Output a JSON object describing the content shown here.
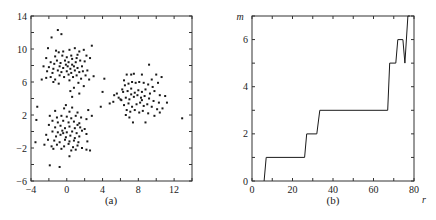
{
  "chart_data": [
    {
      "type": "scatter",
      "panel_label": "(a)",
      "title": "",
      "xlabel": "",
      "ylabel": "",
      "xlim": [
        -4,
        14
      ],
      "ylim": [
        -6,
        14
      ],
      "xticks": [
        -4,
        0,
        4,
        8,
        12
      ],
      "yticks": [
        -6,
        -2,
        2,
        6,
        10,
        14
      ],
      "xtick_labels": [
        "−4",
        "0",
        "4",
        "8",
        "12"
      ],
      "ytick_labels": [
        "−6",
        "−2",
        "2",
        "6",
        "10",
        "14"
      ],
      "minor_step": 2,
      "grid": false,
      "legend": null,
      "marker_color": "#1a1a1a",
      "series": [
        {
          "name": "cluster-upper-left",
          "points": [
            [
              -1.0,
              12.3
            ],
            [
              -0.6,
              11.8
            ],
            [
              -1.7,
              11.4
            ],
            [
              -2.1,
              10.1
            ],
            [
              -1.2,
              9.8
            ],
            [
              -0.9,
              9.6
            ],
            [
              -0.4,
              9.7
            ],
            [
              0.3,
              9.9
            ],
            [
              0.9,
              10.1
            ],
            [
              1.4,
              9.7
            ],
            [
              1.9,
              9.9
            ],
            [
              2.8,
              10.4
            ],
            [
              2.2,
              9.2
            ],
            [
              1.2,
              9.3
            ],
            [
              0.5,
              9.2
            ],
            [
              0.0,
              9.0
            ],
            [
              -0.5,
              9.2
            ],
            [
              -1.3,
              9.1
            ],
            [
              -2.3,
              8.9
            ],
            [
              -1.8,
              8.4
            ],
            [
              -1.1,
              8.6
            ],
            [
              -0.7,
              8.3
            ],
            [
              -0.2,
              8.6
            ],
            [
              0.2,
              8.4
            ],
            [
              0.6,
              8.8
            ],
            [
              1.0,
              8.4
            ],
            [
              1.5,
              8.6
            ],
            [
              2.0,
              8.5
            ],
            [
              2.6,
              8.9
            ],
            [
              -2.6,
              7.9
            ],
            [
              -2.0,
              7.8
            ],
            [
              -1.5,
              7.6
            ],
            [
              -0.8,
              7.9
            ],
            [
              -0.4,
              7.7
            ],
            [
              0.1,
              7.9
            ],
            [
              0.4,
              7.6
            ],
            [
              0.8,
              7.9
            ],
            [
              1.2,
              7.7
            ],
            [
              1.7,
              7.9
            ],
            [
              -2.2,
              7.3
            ],
            [
              -1.6,
              7.1
            ],
            [
              -1.0,
              7.4
            ],
            [
              -0.6,
              7.2
            ],
            [
              0.0,
              7.3
            ],
            [
              0.5,
              7.1
            ],
            [
              0.9,
              7.4
            ],
            [
              1.4,
              7.2
            ],
            [
              1.8,
              7.3
            ],
            [
              2.3,
              7.4
            ],
            [
              -2.8,
              6.3
            ],
            [
              -2.3,
              6.5
            ],
            [
              -1.8,
              6.6
            ],
            [
              -1.3,
              6.3
            ],
            [
              -0.8,
              6.8
            ],
            [
              -0.3,
              6.6
            ],
            [
              0.2,
              6.9
            ],
            [
              0.7,
              6.6
            ],
            [
              1.1,
              6.8
            ],
            [
              1.6,
              6.4
            ],
            [
              2.1,
              6.8
            ],
            [
              2.5,
              6.3
            ],
            [
              3.0,
              6.7
            ],
            [
              -1.5,
              6.0
            ],
            [
              -0.9,
              5.8
            ],
            [
              0.3,
              6.2
            ],
            [
              1.3,
              5.9
            ],
            [
              1.9,
              5.5
            ],
            [
              0.8,
              5.3
            ],
            [
              0.4,
              4.9
            ],
            [
              1.4,
              4.6
            ],
            [
              0.6,
              4.2
            ],
            [
              -0.1,
              8.1
            ],
            [
              0.6,
              8.1
            ],
            [
              -1.4,
              8.2
            ],
            [
              1.1,
              8.9
            ]
          ]
        },
        {
          "name": "cluster-lower-left",
          "points": [
            [
              -3.3,
              3.0
            ],
            [
              -3.4,
              1.4
            ],
            [
              -3.5,
              -1.3
            ],
            [
              -0.1,
              3.2
            ],
            [
              -0.3,
              2.8
            ],
            [
              0.6,
              2.9
            ],
            [
              -1.3,
              2.5
            ],
            [
              0.3,
              2.4
            ],
            [
              1.2,
              2.3
            ],
            [
              2.4,
              2.6
            ],
            [
              2.8,
              1.9
            ],
            [
              -1.9,
              1.9
            ],
            [
              -1.1,
              1.7
            ],
            [
              -0.6,
              1.9
            ],
            [
              0.0,
              1.8
            ],
            [
              0.5,
              1.6
            ],
            [
              1.0,
              1.9
            ],
            [
              1.6,
              1.7
            ],
            [
              2.2,
              1.5
            ],
            [
              -1.6,
              1.3
            ],
            [
              -1.0,
              1.1
            ],
            [
              -0.4,
              1.3
            ],
            [
              0.2,
              1.1
            ],
            [
              0.8,
              1.2
            ],
            [
              1.4,
              1.0
            ],
            [
              -2.0,
              0.8
            ],
            [
              -1.3,
              0.5
            ],
            [
              -0.7,
              0.7
            ],
            [
              -0.2,
              0.4
            ],
            [
              0.3,
              0.6
            ],
            [
              0.9,
              0.4
            ],
            [
              1.5,
              0.5
            ],
            [
              2.0,
              0.3
            ],
            [
              -1.6,
              0.0
            ],
            [
              -1.0,
              -0.1
            ],
            [
              -0.5,
              0.1
            ],
            [
              0.0,
              -0.1
            ],
            [
              0.6,
              0.0
            ],
            [
              1.1,
              -0.2
            ],
            [
              1.7,
              0.1
            ],
            [
              -2.3,
              -0.4
            ],
            [
              -1.2,
              -0.6
            ],
            [
              -0.7,
              -0.4
            ],
            [
              -0.1,
              -0.7
            ],
            [
              0.4,
              -0.5
            ],
            [
              0.9,
              -0.8
            ],
            [
              1.4,
              -0.6
            ],
            [
              2.2,
              -0.3
            ],
            [
              -2.1,
              -1.0
            ],
            [
              -1.4,
              -1.1
            ],
            [
              -0.8,
              -1.3
            ],
            [
              -0.2,
              -1.0
            ],
            [
              0.3,
              -1.2
            ],
            [
              0.8,
              -1.1
            ],
            [
              1.3,
              -1.3
            ],
            [
              2.3,
              -1.2
            ],
            [
              -2.5,
              -1.6
            ],
            [
              -1.7,
              -1.8
            ],
            [
              -1.1,
              -1.6
            ],
            [
              -0.3,
              -1.8
            ],
            [
              0.2,
              -1.5
            ],
            [
              0.7,
              -1.9
            ],
            [
              1.2,
              -1.7
            ],
            [
              1.7,
              -2.0
            ],
            [
              -1.5,
              -2.1
            ],
            [
              -0.6,
              -2.1
            ],
            [
              0.5,
              -2.3
            ],
            [
              1.0,
              -2.2
            ],
            [
              2.2,
              -2.2
            ],
            [
              2.6,
              -2.3
            ],
            [
              0.3,
              -3.0
            ],
            [
              -1.9,
              -4.1
            ],
            [
              -0.8,
              -4.3
            ],
            [
              -0.4,
              -0.2
            ],
            [
              1.2,
              0.8
            ]
          ]
        },
        {
          "name": "cluster-right",
          "points": [
            [
              4.2,
              6.4
            ],
            [
              4.0,
              4.8
            ],
            [
              3.8,
              3.0
            ],
            [
              4.8,
              3.4
            ],
            [
              5.2,
              3.6
            ],
            [
              5.3,
              4.4
            ],
            [
              5.6,
              4.6
            ],
            [
              5.8,
              4.1
            ],
            [
              6.0,
              3.9
            ],
            [
              6.2,
              5.1
            ],
            [
              6.4,
              6.2
            ],
            [
              6.7,
              6.9
            ],
            [
              7.2,
              6.9
            ],
            [
              7.5,
              7.0
            ],
            [
              8.4,
              6.9
            ],
            [
              9.2,
              8.1
            ],
            [
              10.0,
              6.9
            ],
            [
              10.6,
              6.6
            ],
            [
              6.5,
              5.6
            ],
            [
              6.9,
              5.8
            ],
            [
              7.3,
              6.0
            ],
            [
              7.7,
              5.9
            ],
            [
              8.1,
              6.0
            ],
            [
              8.6,
              5.9
            ],
            [
              9.1,
              5.7
            ],
            [
              9.6,
              5.4
            ],
            [
              10.2,
              5.9
            ],
            [
              6.3,
              4.8
            ],
            [
              6.8,
              4.9
            ],
            [
              7.2,
              5.2
            ],
            [
              7.6,
              4.7
            ],
            [
              8.0,
              5.0
            ],
            [
              8.4,
              4.8
            ],
            [
              8.8,
              5.1
            ],
            [
              9.3,
              4.6
            ],
            [
              9.8,
              4.9
            ],
            [
              10.4,
              4.4
            ],
            [
              11.0,
              4.3
            ],
            [
              6.1,
              3.8
            ],
            [
              6.6,
              4.1
            ],
            [
              7.0,
              3.9
            ],
            [
              7.5,
              4.2
            ],
            [
              7.9,
              4.4
            ],
            [
              8.3,
              4.1
            ],
            [
              8.7,
              4.3
            ],
            [
              9.2,
              4.0
            ],
            [
              9.7,
              3.7
            ],
            [
              10.3,
              3.5
            ],
            [
              11.2,
              3.5
            ],
            [
              6.4,
              3.2
            ],
            [
              6.9,
              3.4
            ],
            [
              7.3,
              3.0
            ],
            [
              7.8,
              3.3
            ],
            [
              8.2,
              3.5
            ],
            [
              8.6,
              3.1
            ],
            [
              9.0,
              3.3
            ],
            [
              9.5,
              3.0
            ],
            [
              10.1,
              2.7
            ],
            [
              10.7,
              2.8
            ],
            [
              6.7,
              2.6
            ],
            [
              7.1,
              2.4
            ],
            [
              7.6,
              2.6
            ],
            [
              8.1,
              2.3
            ],
            [
              8.5,
              2.5
            ],
            [
              9.1,
              2.2
            ],
            [
              9.8,
              1.9
            ],
            [
              10.4,
              2.3
            ],
            [
              6.6,
              2.0
            ],
            [
              7.0,
              1.7
            ],
            [
              7.4,
              1.1
            ],
            [
              8.8,
              1.1
            ],
            [
              8.4,
              3.8
            ],
            [
              7.2,
              4.5
            ],
            [
              12.9,
              1.6
            ],
            [
              9.5,
              6.3
            ]
          ]
        }
      ]
    },
    {
      "type": "line",
      "panel_label": "(b)",
      "title": "",
      "xlabel": "r",
      "ylabel": "m",
      "xlim": [
        0,
        80
      ],
      "ylim": [
        0,
        7
      ],
      "xticks": [
        0,
        20,
        40,
        60,
        80
      ],
      "yticks": [
        0,
        2,
        4,
        6
      ],
      "xtick_labels": [
        "0",
        "20",
        "40",
        "60",
        "80"
      ],
      "ytick_labels": [
        "0",
        "2",
        "4",
        "6"
      ],
      "x_minor_step": 10,
      "y_minor_step": 1,
      "grid": false,
      "legend": null,
      "line_color": "#1a1a1a",
      "series": [
        {
          "name": "m(r)",
          "x": [
            6,
            7,
            26,
            27,
            32,
            33.5,
            67,
            68,
            71,
            72,
            74.5,
            75.5,
            77,
            78
          ],
          "y": [
            0,
            1,
            1,
            2,
            2,
            3,
            3,
            5,
            5,
            6,
            6,
            5,
            7,
            7.5
          ]
        }
      ]
    }
  ],
  "labels": {
    "panel_a": "(a)",
    "panel_b": "(b)",
    "axis_m": "m",
    "axis_r": "r"
  }
}
